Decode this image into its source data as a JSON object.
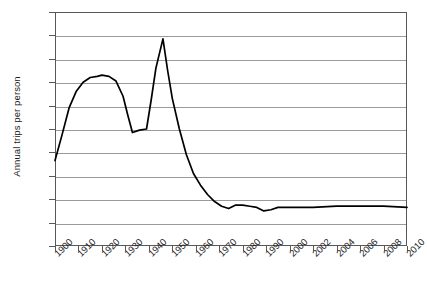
{
  "chart_data": {
    "type": "line",
    "title": "",
    "xlabel": "",
    "ylabel": "Annual trips per person",
    "ylim": [
      0,
      200
    ],
    "ytick_step": 20,
    "yticks": [
      200,
      180,
      160,
      140,
      120,
      100,
      80,
      60,
      40,
      20,
      0
    ],
    "grid": true,
    "legend": "none",
    "xtick_labels": [
      "1900",
      "1910",
      "1920",
      "1930",
      "1940",
      "1950",
      "1960",
      "1970",
      "1980",
      "1990",
      "2000",
      "2002",
      "2004",
      "2006",
      "2008",
      "2010"
    ],
    "series": [
      {
        "name": "Annual trips per person",
        "color": "#000000",
        "points": [
          {
            "x": 1900,
            "y": 73
          },
          {
            "x": 1903,
            "y": 95
          },
          {
            "x": 1906,
            "y": 118
          },
          {
            "x": 1909,
            "y": 132
          },
          {
            "x": 1912,
            "y": 140
          },
          {
            "x": 1915,
            "y": 144
          },
          {
            "x": 1918,
            "y": 145
          },
          {
            "x": 1920,
            "y": 146
          },
          {
            "x": 1923,
            "y": 145
          },
          {
            "x": 1926,
            "y": 141
          },
          {
            "x": 1929,
            "y": 128
          },
          {
            "x": 1931,
            "y": 112
          },
          {
            "x": 1933,
            "y": 97
          },
          {
            "x": 1936,
            "y": 99
          },
          {
            "x": 1939,
            "y": 100
          },
          {
            "x": 1941,
            "y": 125
          },
          {
            "x": 1943,
            "y": 152
          },
          {
            "x": 1946,
            "y": 177
          },
          {
            "x": 1948,
            "y": 150
          },
          {
            "x": 1950,
            "y": 126
          },
          {
            "x": 1953,
            "y": 100
          },
          {
            "x": 1956,
            "y": 78
          },
          {
            "x": 1959,
            "y": 62
          },
          {
            "x": 1962,
            "y": 52
          },
          {
            "x": 1965,
            "y": 44
          },
          {
            "x": 1968,
            "y": 38
          },
          {
            "x": 1971,
            "y": 34
          },
          {
            "x": 1974,
            "y": 32
          },
          {
            "x": 1977,
            "y": 35
          },
          {
            "x": 1980,
            "y": 35
          },
          {
            "x": 1983,
            "y": 34
          },
          {
            "x": 1986,
            "y": 33
          },
          {
            "x": 1989,
            "y": 30
          },
          {
            "x": 1992,
            "y": 31
          },
          {
            "x": 1995,
            "y": 33
          },
          {
            "x": 1998,
            "y": 33
          },
          {
            "x": 2000,
            "y": 33
          },
          {
            "x": 2002,
            "y": 33
          },
          {
            "x": 2004,
            "y": 34
          },
          {
            "x": 2006,
            "y": 34
          },
          {
            "x": 2008,
            "y": 34
          },
          {
            "x": 2010,
            "y": 33
          }
        ]
      }
    ]
  }
}
